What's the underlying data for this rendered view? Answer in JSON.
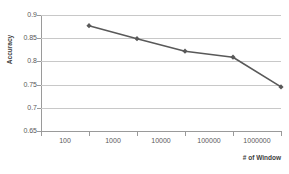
{
  "chart_data": {
    "type": "line",
    "title": "",
    "xlabel": "# of Window",
    "ylabel": "Accuracy",
    "categories": [
      "100",
      "1000",
      "10000",
      "100000",
      "1000000"
    ],
    "values": [
      0.877,
      0.849,
      0.822,
      0.809,
      0.745
    ],
    "series": [
      {
        "name": "Accuracy",
        "values": [
          0.877,
          0.849,
          0.822,
          0.809,
          0.745
        ],
        "color": "#595959",
        "marker": "diamond"
      }
    ],
    "ylim": [
      0.65,
      0.9
    ],
    "yticks": [
      0.9,
      0.85,
      0.8,
      0.75,
      0.7,
      0.65
    ],
    "ytick_labels": [
      "0.9",
      "0.85",
      "0.8",
      "0.75",
      "0.7",
      "0.65"
    ],
    "xtick_labels": [
      "100",
      "1000",
      "10000",
      "100000",
      "1000000"
    ],
    "grid": "horizontal",
    "gridline_color": "#c8c8c8",
    "axis_color": "#9a9a9a",
    "legend": "none",
    "background": "#ffffff"
  }
}
